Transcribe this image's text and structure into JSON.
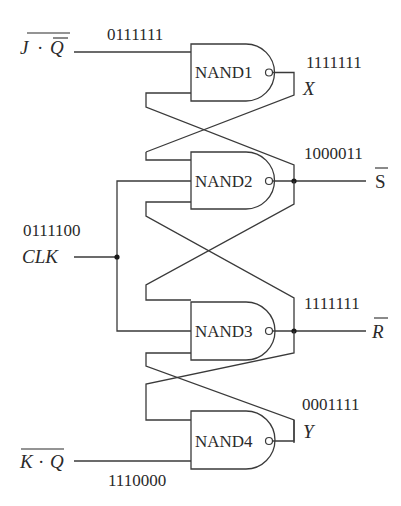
{
  "diagram": {
    "title": "",
    "gates": [
      {
        "id": "nand1",
        "label": "NAND1",
        "type": "NAND"
      },
      {
        "id": "nand2",
        "label": "NAND2",
        "type": "NAND"
      },
      {
        "id": "nand3",
        "label": "NAND3",
        "type": "NAND"
      },
      {
        "id": "nand4",
        "label": "NAND4",
        "type": "NAND"
      }
    ],
    "inputs": {
      "j_qbar": {
        "label_main": "J",
        "label_dot": "·",
        "label_second": "Q",
        "overbar_whole": true,
        "overbar_inner": "Q",
        "bits": "0111111"
      },
      "clk": {
        "label": "CLK",
        "bits": "0111100"
      },
      "k_q": {
        "label_main": "K",
        "label_dot": "·",
        "label_second": "Q",
        "overbar_whole": true,
        "bits": "1110000"
      }
    },
    "outputs": {
      "x": {
        "label": "X",
        "bits": "1111111"
      },
      "s_bar": {
        "label": "S",
        "overbar": true,
        "bits": "1000011"
      },
      "r_bar": {
        "label": "R",
        "overbar": true,
        "bits": "1111111"
      },
      "y": {
        "label": "Y",
        "bits": "0001111"
      }
    },
    "colors": {
      "line": "#3a3a3a",
      "text": "#2a2a2a",
      "background": "#ffffff"
    }
  }
}
